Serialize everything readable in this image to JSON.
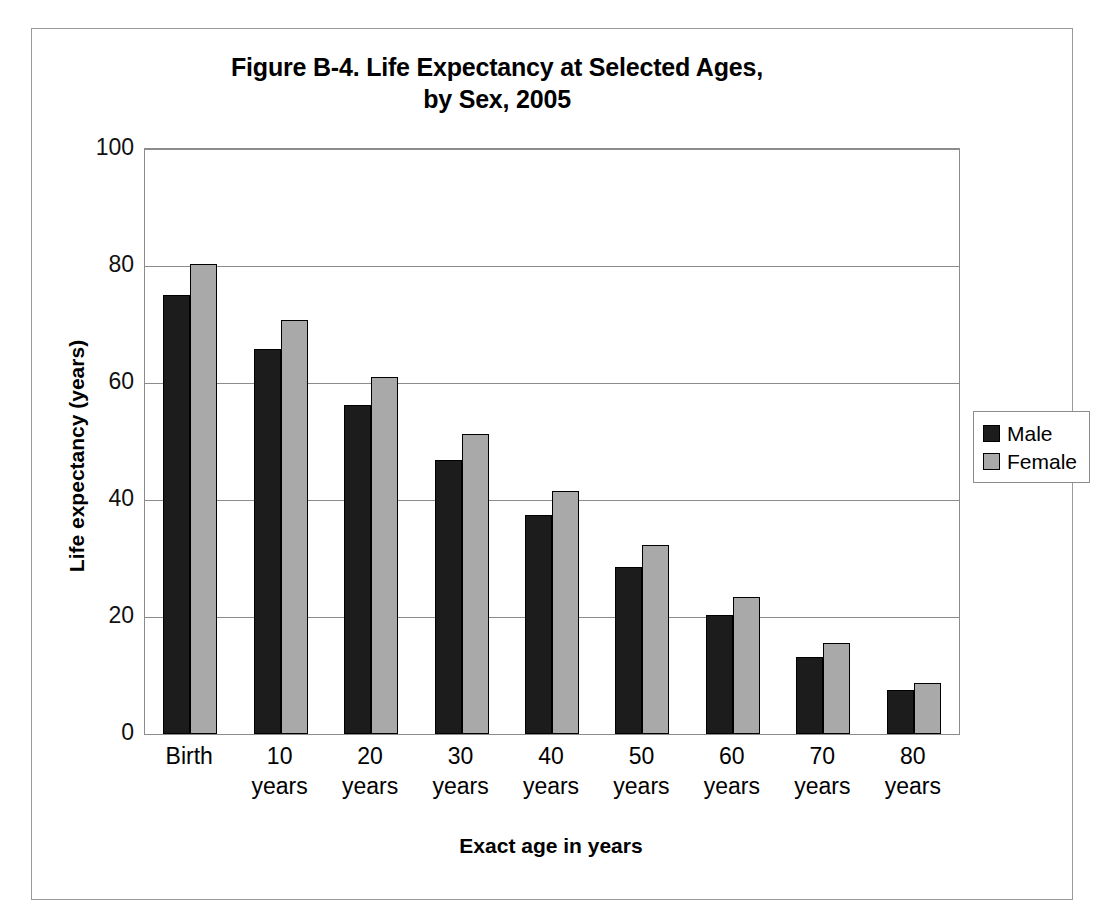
{
  "chart_data": {
    "type": "bar",
    "title": "Figure B-4. Life Expectancy at Selected Ages,",
    "title_line2": "by Sex, 2005",
    "xlabel": "Exact age in years",
    "ylabel": "Life expectancy (years)",
    "ylim": [
      0,
      100
    ],
    "ytick_values": [
      0,
      20,
      40,
      60,
      80,
      100
    ],
    "ytick_labels": [
      "0",
      "20",
      "40",
      "60",
      "80",
      "100"
    ],
    "grid": true,
    "legend_position": "right",
    "categories": [
      "Birth",
      "10 years",
      "20 years",
      "30 years",
      "40 years",
      "50 years",
      "60 years",
      "70 years",
      "80 years"
    ],
    "category_labels": [
      {
        "main": "Birth",
        "sub": ""
      },
      {
        "main": "10",
        "sub": "years"
      },
      {
        "main": "20",
        "sub": "years"
      },
      {
        "main": "30",
        "sub": "years"
      },
      {
        "main": "40",
        "sub": "years"
      },
      {
        "main": "50",
        "sub": "years"
      },
      {
        "main": "60",
        "sub": "years"
      },
      {
        "main": "70",
        "sub": "years"
      },
      {
        "main": "80",
        "sub": "years"
      }
    ],
    "series": [
      {
        "name": "Male",
        "color": "#1c1c1c",
        "values": [
          75.0,
          65.9,
          56.2,
          46.8,
          37.4,
          28.6,
          20.3,
          13.2,
          7.5
        ]
      },
      {
        "name": "Female",
        "color": "#a9a9a9",
        "values": [
          80.4,
          70.8,
          61.0,
          51.2,
          41.6,
          32.3,
          23.4,
          15.6,
          8.8
        ]
      }
    ]
  },
  "legend": {
    "entries": [
      {
        "label": "Male"
      },
      {
        "label": "Female"
      }
    ]
  }
}
